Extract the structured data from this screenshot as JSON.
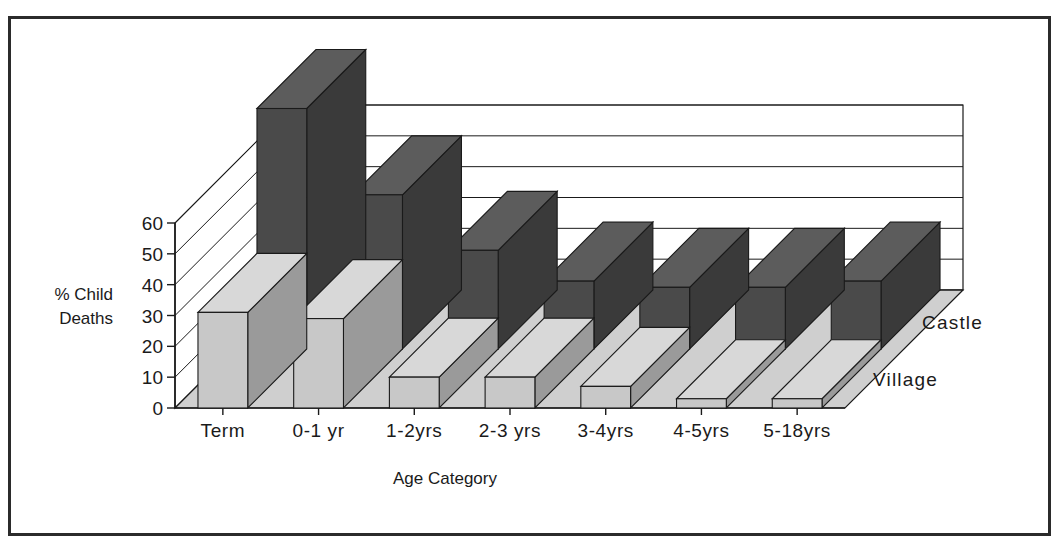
{
  "chart_data": {
    "type": "bar",
    "title": "",
    "subtitle": "",
    "xlabel": "Age Category",
    "ylabel": "% Child Deaths",
    "ylabel_lines": [
      "% Child",
      "Deaths"
    ],
    "zlabel": "",
    "categories": [
      "Term",
      "0-1 yr",
      "1-2yrs",
      "2-3 yrs",
      "3-4yrs",
      "4-5yrs",
      "5-18yrs"
    ],
    "series": [
      {
        "name": "Village",
        "values": [
          31,
          29,
          10,
          10,
          7,
          3,
          3
        ],
        "color": "#c8c8c8"
      },
      {
        "name": "Castle",
        "values": [
          78,
          50,
          32,
          22,
          20,
          20,
          22
        ],
        "color": "#4a4a4a"
      }
    ],
    "yticks": [
      0,
      10,
      20,
      30,
      40,
      50,
      60
    ],
    "ylim": [
      0,
      60
    ],
    "ytick_labels": [
      "0",
      "10",
      "20",
      "30",
      "40",
      "50",
      "60"
    ],
    "grid": true,
    "legend_position": "right-axis-3d",
    "projection": "3d",
    "annotations": []
  },
  "colors": {
    "village_front": "#c8c8c8",
    "village_side": "#9a9a9a",
    "village_top": "#d8d8d8",
    "castle_front": "#4a4a4a",
    "castle_side": "#3a3a3a",
    "castle_top": "#5c5c5c",
    "floor": "#cfcfcf",
    "wall": "#ffffff",
    "outline": "#1a1a1a",
    "frame": "#2b2b2b",
    "background": "#ffffff"
  }
}
